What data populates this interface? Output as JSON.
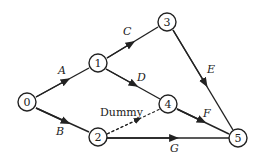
{
  "diagram": {
    "type": "activity-network",
    "nodes": [
      {
        "id": "0",
        "x": 27,
        "y": 102
      },
      {
        "id": "1",
        "x": 98,
        "y": 63
      },
      {
        "id": "2",
        "x": 98,
        "y": 137
      },
      {
        "id": "3",
        "x": 167,
        "y": 22
      },
      {
        "id": "4",
        "x": 168,
        "y": 104
      },
      {
        "id": "5",
        "x": 238,
        "y": 138
      }
    ],
    "edges": [
      {
        "from": "0",
        "to": "1",
        "label": "A"
      },
      {
        "from": "0",
        "to": "2",
        "label": "B"
      },
      {
        "from": "1",
        "to": "3",
        "label": "C"
      },
      {
        "from": "1",
        "to": "4",
        "label": "D"
      },
      {
        "from": "3",
        "to": "5",
        "label": "E"
      },
      {
        "from": "4",
        "to": "5",
        "label": "F"
      },
      {
        "from": "2",
        "to": "5",
        "label": "G"
      },
      {
        "from": "2",
        "to": "4",
        "label": "Dummy",
        "dashed": true
      }
    ]
  },
  "labels": {
    "n0": "0",
    "n1": "1",
    "n2": "2",
    "n3": "3",
    "n4": "4",
    "n5": "5",
    "A": "A",
    "B": "B",
    "C": "C",
    "D": "D",
    "E": "E",
    "F": "F",
    "G": "G",
    "dummy": "Dummy"
  }
}
